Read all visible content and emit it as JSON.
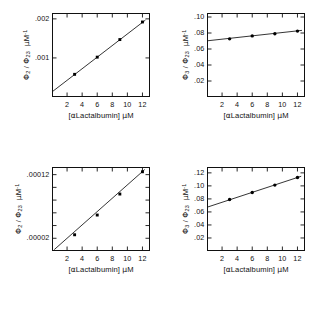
{
  "figure": {
    "background": "#ffffff",
    "ink_color": "#111111",
    "marker_color": "#000000",
    "panel_count": 4
  },
  "chart_data": [
    {
      "id": "panel-top-left",
      "type": "scatter",
      "title": "",
      "xlabel": "[αLactalbumin] μM",
      "ylabel": "Φ₂ / Φ₂₃  μM⁻¹",
      "ylabel_parts": {
        "num": "2",
        "den": "23",
        "units": "μM",
        "units_exp": "-1"
      },
      "x": [
        3,
        6,
        9,
        12
      ],
      "y": [
        0.00058,
        0.00102,
        0.00147,
        0.00192
      ],
      "fit_line": {
        "x": [
          0,
          12.4
        ],
        "y": [
          0.00013,
          0.00197
        ]
      },
      "xlim": [
        0,
        13
      ],
      "ylim": [
        0,
        0.00215
      ],
      "xticks": [
        2,
        4,
        6,
        8,
        10,
        12
      ],
      "xtick_labels": [
        "2",
        "4",
        "6",
        "8",
        "10",
        "12"
      ],
      "yticks": [
        0.001,
        0.002
      ],
      "ytick_labels": [
        ".001",
        ".002"
      ],
      "grid": false,
      "legend": "none",
      "marker": "square"
    },
    {
      "id": "panel-top-right",
      "type": "scatter",
      "title": "",
      "xlabel": "[αLactalbumin] μM",
      "ylabel": "Φ₃ / Φ₂₃  μM⁻¹",
      "ylabel_parts": {
        "num": "3",
        "den": "23",
        "units": "μM",
        "units_exp": "-1"
      },
      "x": [
        3,
        6,
        9,
        12
      ],
      "y": [
        0.0727,
        0.0764,
        0.0791,
        0.0824
      ],
      "fit_line": {
        "x": [
          0,
          12.6
        ],
        "y": [
          0.0702,
          0.0833
        ]
      },
      "xlim": [
        0,
        13
      ],
      "ylim": [
        0,
        0.105
      ],
      "xticks": [
        2,
        4,
        6,
        8,
        10,
        12
      ],
      "xtick_labels": [
        "2",
        "4",
        "6",
        "8",
        "10",
        "12"
      ],
      "yticks": [
        0.02,
        0.04,
        0.06,
        0.08,
        0.1
      ],
      "ytick_labels": [
        ".02",
        ".04",
        ".06",
        ".08",
        ".10"
      ],
      "grid": false,
      "legend": "none",
      "marker": "circle"
    },
    {
      "id": "panel-bottom-left",
      "type": "scatter",
      "title": "",
      "xlabel": "[αLactalbumin] μM",
      "ylabel": "Φ₂ / Φ₂₃  μM⁻¹",
      "ylabel_parts": {
        "num": "2",
        "den": "23",
        "units": "μM",
        "units_exp": "-1"
      },
      "x": [
        3,
        6,
        9,
        12
      ],
      "y": [
        2.55e-05,
        5.65e-05,
        8.95e-05,
        0.0001245
      ],
      "fit_line": {
        "x": [
          0.3,
          12.3
        ],
        "y": [
          2.2e-06,
          0.000128
        ]
      },
      "xlim": [
        0,
        13
      ],
      "ylim": [
        0,
        0.000132
      ],
      "xticks": [
        2,
        4,
        6,
        8,
        10,
        12
      ],
      "xtick_labels": [
        "2",
        "4",
        "6",
        "8",
        "10",
        "12"
      ],
      "yticks": [
        2e-05,
        4e-05,
        6e-05,
        8e-05,
        0.0001,
        0.00012
      ],
      "ytick_labels": [
        ".00002",
        "",
        "",
        "",
        "",
        ".00012"
      ],
      "grid": false,
      "legend": "none",
      "marker": "square"
    },
    {
      "id": "panel-bottom-right",
      "type": "scatter",
      "title": "",
      "xlabel": "[αLactalbumin] μM",
      "ylabel": "Φ₃ / Φ₂₃  μM⁻¹",
      "ylabel_parts": {
        "num": "3",
        "den": "23",
        "units": "μM",
        "units_exp": "-1"
      },
      "x": [
        3,
        6,
        9,
        12
      ],
      "y": [
        0.079,
        0.0898,
        0.1012,
        0.1128
      ],
      "fit_line": {
        "x": [
          0,
          12.5
        ],
        "y": [
          0.0672,
          0.1148
        ]
      },
      "xlim": [
        0,
        13
      ],
      "ylim": [
        0,
        0.129
      ],
      "xticks": [
        2,
        4,
        6,
        8,
        10,
        12
      ],
      "xtick_labels": [
        "2",
        "4",
        "6",
        "8",
        "10",
        "12"
      ],
      "yticks": [
        0.02,
        0.04,
        0.06,
        0.08,
        0.1,
        0.12
      ],
      "ytick_labels": [
        ".02",
        ".04",
        ".06",
        ".08",
        ".10",
        ".12"
      ],
      "grid": false,
      "legend": "none",
      "marker": "circle"
    }
  ]
}
